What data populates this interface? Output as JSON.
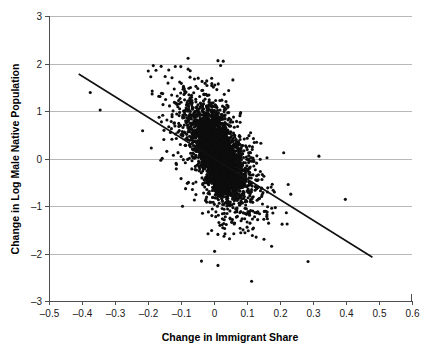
{
  "chart_data": {
    "type": "scatter",
    "title": "",
    "xlabel": "Change in Immigrant Share",
    "ylabel": "Change in Log Male Native Population",
    "xlim": [
      -0.5,
      0.6
    ],
    "ylim": [
      -3,
      3
    ],
    "xticks": [
      -0.5,
      -0.4,
      -0.3,
      -0.2,
      -0.1,
      0,
      0.1,
      0.2,
      0.3,
      0.4,
      0.5,
      0.6
    ],
    "xticklabels": [
      "-0.5",
      "-0.4",
      "-0.3",
      "-0.2",
      "-0.1",
      "0",
      "0.1",
      "0.2",
      "0.3",
      "0.4",
      "0.5",
      "0.6"
    ],
    "yticks": [
      3,
      2,
      1,
      0,
      -1,
      -2,
      -3
    ],
    "yticklabels": [
      "3",
      "2",
      "1",
      "0",
      "-1",
      "-2",
      "-3"
    ],
    "grid": "horizontal",
    "legend": "none",
    "marker_color": "#0d0d0d",
    "marker_size": 1.55,
    "point_count": 4200,
    "cloud": {
      "center_x": 0.012,
      "center_y": 0.08,
      "sd_x": 0.055,
      "sd_y": 0.62,
      "correlation": -0.62,
      "x_observed_range": [
        -0.42,
        0.41
      ],
      "y_observed_range": [
        -2.25,
        2.06
      ]
    },
    "fit_line": {
      "type": "linear",
      "x_start": -0.41,
      "y_start": 1.78,
      "x_end": 0.48,
      "y_end": -2.08,
      "slope": -4.34,
      "intercept": 0.0,
      "color": "#111111"
    },
    "outliers": [
      {
        "x": -0.038,
        "y": -2.16
      },
      {
        "x": 0.012,
        "y": -2.25
      },
      {
        "x": 0.285,
        "y": -2.17
      },
      {
        "x": -0.375,
        "y": 1.39
      },
      {
        "x": -0.345,
        "y": 1.02
      },
      {
        "x": 0.012,
        "y": 2.06
      },
      {
        "x": 0.028,
        "y": 2.05
      },
      {
        "x": 0.398,
        "y": -0.86
      },
      {
        "x": 0.318,
        "y": 0.05
      }
    ]
  },
  "axes": {
    "x_axis_name": "x-axis",
    "y_axis_name": "y-axis"
  }
}
